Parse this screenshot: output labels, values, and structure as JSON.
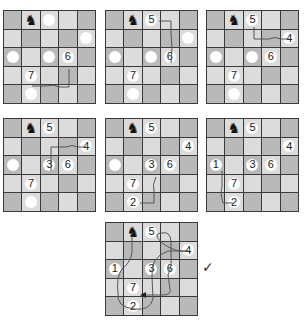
{
  "puzzle": {
    "grid_size": 5,
    "knight_glyph": "♞",
    "shading": [
      [
        "d",
        "l",
        "l",
        "l",
        "d"
      ],
      [
        "l",
        "d",
        "l",
        "d",
        "l"
      ],
      [
        "d",
        "l",
        "d",
        "l",
        "d"
      ],
      [
        "l",
        "l",
        "l",
        "d",
        "l"
      ],
      [
        "d",
        "l",
        "d",
        "l",
        "d"
      ]
    ],
    "knight_position": [
      0,
      1
    ],
    "colors": {
      "dark_cell": "#b9b9b9",
      "light_cell": "#dcdcdc",
      "disc": "#ffffff",
      "line": "#555555"
    }
  },
  "boards": [
    {
      "name": "step-1",
      "x": 3,
      "y": 10,
      "discs": [
        {
          "r": 0,
          "c": 2,
          "label": ""
        },
        {
          "r": 1,
          "c": 4,
          "label": ""
        },
        {
          "r": 2,
          "c": 0,
          "label": ""
        },
        {
          "r": 2,
          "c": 2,
          "label": ""
        },
        {
          "r": 2,
          "c": 3,
          "label": "6"
        },
        {
          "r": 3,
          "c": 1,
          "label": "7"
        },
        {
          "r": 4,
          "c": 1,
          "label": ""
        }
      ],
      "path": "M28,75 L42,75 Q50,73 56,76 L65,76 L65,58"
    },
    {
      "name": "step-2",
      "x": 105,
      "y": 10,
      "discs": [
        {
          "r": 0,
          "c": 2,
          "label": "5"
        },
        {
          "r": 1,
          "c": 4,
          "label": ""
        },
        {
          "r": 2,
          "c": 0,
          "label": ""
        },
        {
          "r": 2,
          "c": 2,
          "label": ""
        },
        {
          "r": 2,
          "c": 3,
          "label": "6"
        },
        {
          "r": 3,
          "c": 1,
          "label": "7"
        },
        {
          "r": 4,
          "c": 1,
          "label": ""
        }
      ],
      "path": "M53,10 L65,10 L65,22 Q67,38 65,52"
    },
    {
      "name": "step-3",
      "x": 206,
      "y": 10,
      "discs": [
        {
          "r": 0,
          "c": 2,
          "label": "5"
        },
        {
          "r": 1,
          "c": 4,
          "label": "4"
        },
        {
          "r": 2,
          "c": 0,
          "label": ""
        },
        {
          "r": 2,
          "c": 2,
          "label": ""
        },
        {
          "r": 2,
          "c": 3,
          "label": "6"
        },
        {
          "r": 3,
          "c": 1,
          "label": "7"
        },
        {
          "r": 4,
          "c": 1,
          "label": ""
        }
      ],
      "path": "M47,16 L47,28 L62,28 Q68,25 74,28 L82,28"
    },
    {
      "name": "step-4",
      "x": 3,
      "y": 118,
      "discs": [
        {
          "r": 0,
          "c": 2,
          "label": "5"
        },
        {
          "r": 1,
          "c": 4,
          "label": "4"
        },
        {
          "r": 2,
          "c": 0,
          "label": ""
        },
        {
          "r": 2,
          "c": 2,
          "label": "3"
        },
        {
          "r": 2,
          "c": 3,
          "label": "6"
        },
        {
          "r": 3,
          "c": 1,
          "label": "7"
        },
        {
          "r": 4,
          "c": 1,
          "label": ""
        }
      ],
      "path": "M47,52 L47,28 L62,28 Q68,25 74,28 L82,28"
    },
    {
      "name": "step-5",
      "x": 105,
      "y": 118,
      "discs": [
        {
          "r": 0,
          "c": 2,
          "label": "5"
        },
        {
          "r": 1,
          "c": 4,
          "label": "4"
        },
        {
          "r": 2,
          "c": 0,
          "label": ""
        },
        {
          "r": 2,
          "c": 2,
          "label": "3"
        },
        {
          "r": 2,
          "c": 3,
          "label": "6"
        },
        {
          "r": 3,
          "c": 1,
          "label": "7"
        },
        {
          "r": 4,
          "c": 1,
          "label": "2"
        }
      ],
      "path": "M34,84 L48,84 L48,72 Q46,66 50,58"
    },
    {
      "name": "step-6",
      "x": 206,
      "y": 118,
      "discs": [
        {
          "r": 0,
          "c": 2,
          "label": "5"
        },
        {
          "r": 1,
          "c": 4,
          "label": "4"
        },
        {
          "r": 2,
          "c": 0,
          "label": "1"
        },
        {
          "r": 2,
          "c": 2,
          "label": "3"
        },
        {
          "r": 2,
          "c": 3,
          "label": "6"
        },
        {
          "r": 3,
          "c": 1,
          "label": "7"
        },
        {
          "r": 4,
          "c": 1,
          "label": "2"
        }
      ],
      "path": "M15,52 L15,68 Q13,74 16,84 L26,84"
    },
    {
      "name": "solution",
      "x": 105,
      "y": 222,
      "discs": [
        {
          "r": 0,
          "c": 2,
          "label": "5"
        },
        {
          "r": 1,
          "c": 4,
          "label": "4"
        },
        {
          "r": 2,
          "c": 0,
          "label": "1"
        },
        {
          "r": 2,
          "c": 2,
          "label": "3"
        },
        {
          "r": 2,
          "c": 3,
          "label": "6"
        },
        {
          "r": 3,
          "c": 1,
          "label": "7"
        },
        {
          "r": 4,
          "c": 1,
          "label": "2"
        }
      ],
      "path": "M26,13 L26,30 Q24,40 16,46 Q10,54 12,70 Q10,84 28,86 Q44,88 47,76 L46,54 Q44,34 62,28 L82,28 Q70,30 56,20 Q46,10 56,10 Q64,8 65,18 L65,32 Q66,44 62,52 L64,66 Q66,72 56,72 L36,72"
    }
  ],
  "checkmark": "✓"
}
